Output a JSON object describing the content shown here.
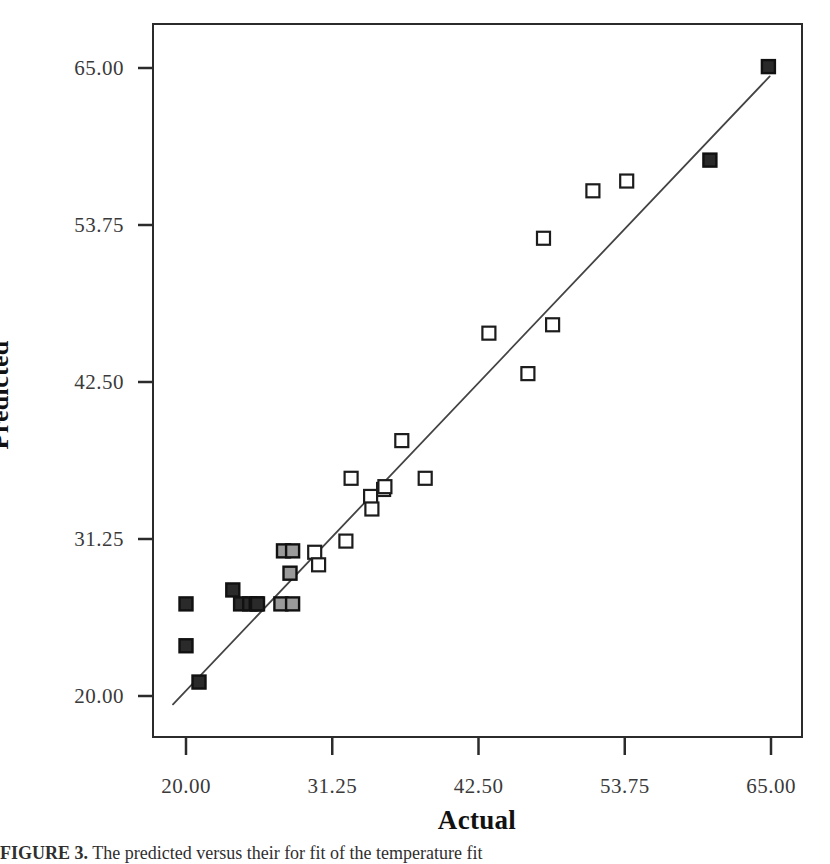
{
  "figure": {
    "caption_label": "FIGURE 3.",
    "caption_text": "The predicted versus their for fit of the temperature fit"
  },
  "chart_data": {
    "type": "scatter",
    "title": "",
    "xlabel": "Actual",
    "ylabel": "Predicted",
    "xlim": [
      16.0,
      66.5
    ],
    "ylim": [
      16.0,
      68.0
    ],
    "xticks": [
      20.0,
      31.25,
      42.5,
      53.75,
      65.0
    ],
    "yticks": [
      20.0,
      31.25,
      42.5,
      53.75,
      65.0
    ],
    "xticklabels": [
      "20.00",
      "31.25",
      "42.50",
      "53.75",
      "65.00"
    ],
    "yticklabels": [
      "20.00",
      "31.25",
      "42.50",
      "53.75",
      "65.00"
    ],
    "grid": false,
    "legend": null,
    "marker_shape": "square",
    "marker_size": 13,
    "colors": {
      "open_marker_fill": "#ffffff",
      "open_marker_edge": "#1c1c1c",
      "filled_marker_fill": "#2a2a2a",
      "filled_marker_edge": "#111111",
      "shaded_marker_fill": "#9a9a9a",
      "fit_line": "#444444",
      "frame": "#2b2b2b",
      "tick_label": "#3a3a3a",
      "axis_title": "#111111"
    },
    "fit_line": {
      "name": "reference-fit-line",
      "x_start": 19.0,
      "y_start": 19.4,
      "x_end": 64.9,
      "y_end": 64.4
    },
    "points": [
      {
        "x": 20.0,
        "y": 23.6,
        "style": "filled"
      },
      {
        "x": 20.0,
        "y": 26.6,
        "style": "filled"
      },
      {
        "x": 21.0,
        "y": 21.0,
        "style": "filled"
      },
      {
        "x": 23.6,
        "y": 27.6,
        "style": "filled"
      },
      {
        "x": 24.2,
        "y": 26.6,
        "style": "filled"
      },
      {
        "x": 24.9,
        "y": 26.6,
        "style": "filled"
      },
      {
        "x": 25.4,
        "y": 26.6,
        "style": "shaded"
      },
      {
        "x": 25.5,
        "y": 26.6,
        "style": "filled"
      },
      {
        "x": 27.3,
        "y": 26.6,
        "style": "shaded"
      },
      {
        "x": 28.2,
        "y": 26.6,
        "style": "shaded"
      },
      {
        "x": 27.5,
        "y": 30.4,
        "style": "shaded"
      },
      {
        "x": 28.2,
        "y": 30.4,
        "style": "shaded"
      },
      {
        "x": 28.0,
        "y": 28.8,
        "style": "shaded"
      },
      {
        "x": 29.9,
        "y": 30.3,
        "style": "open"
      },
      {
        "x": 30.2,
        "y": 29.4,
        "style": "open"
      },
      {
        "x": 32.3,
        "y": 31.1,
        "style": "open"
      },
      {
        "x": 32.7,
        "y": 35.6,
        "style": "open"
      },
      {
        "x": 34.2,
        "y": 34.3,
        "style": "open"
      },
      {
        "x": 34.3,
        "y": 33.4,
        "style": "open"
      },
      {
        "x": 35.2,
        "y": 34.8,
        "style": "open"
      },
      {
        "x": 35.3,
        "y": 35.0,
        "style": "open"
      },
      {
        "x": 36.6,
        "y": 38.3,
        "style": "open"
      },
      {
        "x": 38.4,
        "y": 35.6,
        "style": "open"
      },
      {
        "x": 43.3,
        "y": 46.0,
        "style": "open"
      },
      {
        "x": 46.3,
        "y": 43.1,
        "style": "open"
      },
      {
        "x": 47.5,
        "y": 52.8,
        "style": "open"
      },
      {
        "x": 48.2,
        "y": 46.6,
        "style": "open"
      },
      {
        "x": 51.3,
        "y": 56.2,
        "style": "open"
      },
      {
        "x": 53.9,
        "y": 56.9,
        "style": "open"
      },
      {
        "x": 60.3,
        "y": 58.4,
        "style": "filled"
      },
      {
        "x": 64.8,
        "y": 65.1,
        "style": "filled"
      }
    ]
  }
}
